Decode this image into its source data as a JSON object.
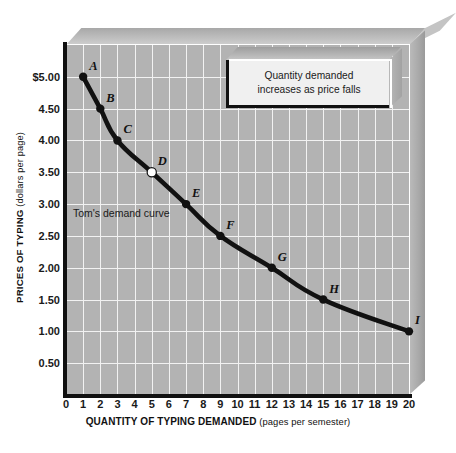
{
  "chart_data": {
    "type": "line",
    "title": "",
    "xlabel_bold": "QUANTITY OF TYPING DEMANDED",
    "xlabel_sub": " (pages per semester)",
    "ylabel_bold": "PRICES OF TYPING",
    "ylabel_sub": " (dollars per page)",
    "xlim": [
      0,
      20
    ],
    "ylim": [
      0,
      5.5
    ],
    "grid": true,
    "legend": "none",
    "series_name": "Tom's demand curve",
    "x": [
      1,
      2,
      3,
      5,
      7,
      9,
      12,
      15,
      20
    ],
    "values": [
      5.0,
      4.5,
      4.0,
      3.5,
      3.0,
      2.5,
      2.0,
      1.5,
      1.0
    ],
    "point_labels": [
      "A",
      "B",
      "C",
      "D",
      "E",
      "F",
      "G",
      "H",
      "I"
    ],
    "points": [
      {
        "label": "A",
        "x": 1,
        "y": 5.0,
        "marker": "filled"
      },
      {
        "label": "B",
        "x": 2,
        "y": 4.5,
        "marker": "filled"
      },
      {
        "label": "C",
        "x": 3,
        "y": 4.0,
        "marker": "filled"
      },
      {
        "label": "D",
        "x": 5,
        "y": 3.5,
        "marker": "hollow"
      },
      {
        "label": "E",
        "x": 7,
        "y": 3.0,
        "marker": "filled"
      },
      {
        "label": "F",
        "x": 9,
        "y": 2.5,
        "marker": "filled"
      },
      {
        "label": "G",
        "x": 12,
        "y": 2.0,
        "marker": "filled"
      },
      {
        "label": "H",
        "x": 15,
        "y": 1.5,
        "marker": "filled"
      },
      {
        "label": "I",
        "x": 20,
        "y": 1.0,
        "marker": "filled"
      }
    ],
    "xticks": [
      "0",
      "1",
      "2",
      "3",
      "4",
      "5",
      "6",
      "7",
      "8",
      "9",
      "10",
      "11",
      "12",
      "13",
      "14",
      "15",
      "16",
      "17",
      "18",
      "19",
      "20"
    ],
    "yticks": [
      "$5.00",
      "4.50",
      "4.00",
      "3.50",
      "3.00",
      "2.50",
      "2.00",
      "1.50",
      "1.00",
      "0.50"
    ],
    "ytick_values": [
      5.0,
      4.5,
      4.0,
      3.5,
      3.0,
      2.5,
      2.0,
      1.5,
      1.0,
      0.5
    ],
    "annotations": [
      {
        "name": "curve-note",
        "text": "Tom's demand curve"
      },
      {
        "name": "callout",
        "line1": "Quantity demanded",
        "line2": "increases as price falls"
      }
    ],
    "colors": {
      "plot_background": "#b3b3b3",
      "gridline": "#f2f2f2",
      "curve": "#111111",
      "axis": "#101010",
      "page_background": "#ffffff",
      "bevel": "#bdbdbd",
      "callout_face": "#f0f0f0"
    }
  },
  "callout": {
    "line1": "Quantity demanded",
    "line2": "increases as price falls"
  },
  "curve_note": "Tom's demand curve",
  "axes": {
    "y_title_bold": "PRICES OF TYPING",
    "y_title_sub": " (dollars per page)",
    "x_title_bold": "QUANTITY OF TYPING DEMANDED",
    "x_title_sub": " (pages per semester)"
  }
}
